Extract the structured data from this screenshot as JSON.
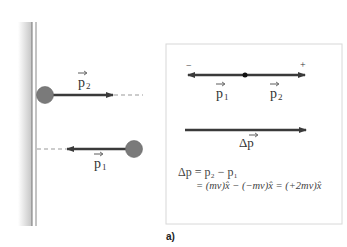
{
  "figure": {
    "caption": "a)",
    "left_panel": {
      "p2_label": "p",
      "p2_sub": "2",
      "p1_label": "p",
      "p1_sub": "1"
    },
    "right_panel": {
      "minus_sign": "−",
      "plus_sign": "+",
      "p1_label": "p",
      "p1_sub": "1",
      "p2_label": "p",
      "p2_sub": "2",
      "delta_p_label": "Δp",
      "equation_line1": "Δp = p₂ − p₁",
      "equation_line2": "= (mv)x̂ − (−mv)x̂ = (+2mv)x̂"
    },
    "colors": {
      "ball": "#7a7a7a",
      "arrow": "#3a3a3a",
      "wall_shade": "#cfcfcf",
      "box_border": "#d8d8d8"
    }
  }
}
